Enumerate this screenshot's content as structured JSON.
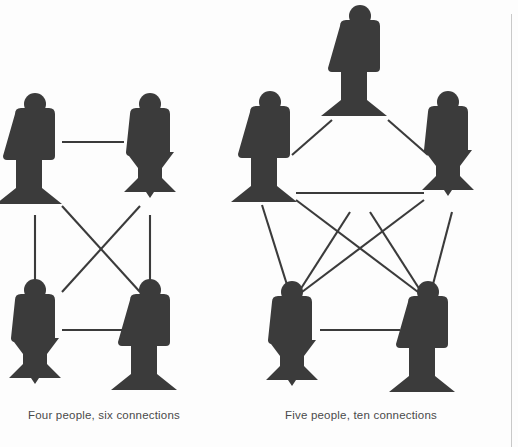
{
  "figure": {
    "ink_color": "#3b3b3b",
    "line_color": "#3b3b3b",
    "background_color": "#fdfdfd",
    "rule_color": "#c9c9c9"
  },
  "panels": [
    {
      "id": "four-people",
      "caption": "Four people, six connections",
      "people_count": 4,
      "connection_count": 6,
      "layout": "square",
      "nodes": [
        {
          "id": "p1",
          "cx": 35,
          "cy": 150,
          "base": "plain"
        },
        {
          "id": "p2",
          "cx": 150,
          "cy": 150,
          "base": "flared"
        },
        {
          "id": "p3",
          "cx": 35,
          "cy": 336,
          "base": "flared"
        },
        {
          "id": "p4",
          "cx": 150,
          "cy": 336,
          "base": "plain"
        }
      ],
      "edges": [
        {
          "from": "p1",
          "to": "p2"
        },
        {
          "from": "p1",
          "to": "p3"
        },
        {
          "from": "p1",
          "to": "p4"
        },
        {
          "from": "p2",
          "to": "p3"
        },
        {
          "from": "p2",
          "to": "p4"
        },
        {
          "from": "p3",
          "to": "p4"
        }
      ]
    },
    {
      "id": "five-people",
      "caption": "Five people, ten connections",
      "people_count": 5,
      "connection_count": 10,
      "layout": "pentagon",
      "nodes": [
        {
          "id": "q1",
          "cx": 360,
          "cy": 62,
          "base": "plain"
        },
        {
          "id": "q2",
          "cx": 270,
          "cy": 148,
          "base": "plain"
        },
        {
          "id": "q3",
          "cx": 448,
          "cy": 148,
          "base": "flared"
        },
        {
          "id": "q4",
          "cx": 292,
          "cy": 338,
          "base": "flared"
        },
        {
          "id": "q5",
          "cx": 428,
          "cy": 338,
          "base": "plain"
        }
      ],
      "edges": [
        {
          "from": "q1",
          "to": "q2"
        },
        {
          "from": "q1",
          "to": "q3"
        },
        {
          "from": "q1",
          "to": "q4"
        },
        {
          "from": "q1",
          "to": "q5"
        },
        {
          "from": "q2",
          "to": "q3"
        },
        {
          "from": "q2",
          "to": "q4"
        },
        {
          "from": "q2",
          "to": "q5"
        },
        {
          "from": "q3",
          "to": "q4"
        },
        {
          "from": "q3",
          "to": "q5"
        },
        {
          "from": "q4",
          "to": "q5"
        }
      ]
    }
  ]
}
